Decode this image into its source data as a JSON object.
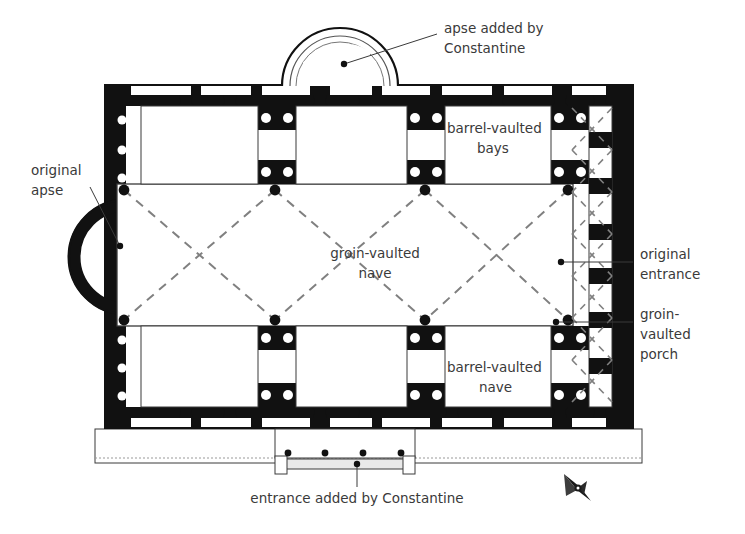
{
  "diagram": {
    "type": "architectural-floor-plan",
    "background_color": "#ffffff",
    "wall_color": "#111111",
    "line_color": "#3a3a3a",
    "text_color": "#3a3a3a",
    "dot_color": "#111111"
  },
  "labels": {
    "apse_added": {
      "line1": "apse added by",
      "line2": "Constantine"
    },
    "original_apse": {
      "line1": "original",
      "line2": "apse"
    },
    "barrel_bays": {
      "line1": "barrel-vaulted",
      "line2": "bays"
    },
    "groin_nave": {
      "line1": "groin-vaulted",
      "line2": "nave"
    },
    "barrel_nave": {
      "line1": "barrel-vaulted",
      "line2": "nave"
    },
    "original_entrance": {
      "line1": "original",
      "line2": "entrance"
    },
    "groin_porch": {
      "line1": "groin-",
      "line2": "vaulted",
      "line3": "porch"
    },
    "entrance_added": {
      "text": "entrance added by Constantine"
    }
  },
  "icons": {
    "compass": "compass-north-arrow-icon"
  },
  "plan_geometry": {
    "outer_wall": {
      "x": 104,
      "y": 84,
      "width": 530,
      "height": 345
    },
    "wall_thickness": 22,
    "nave_bays": 3,
    "porch_bays": 6,
    "apse_added_radius": 58,
    "original_apse_radius": 52,
    "entrance_columns": 4,
    "platform": {
      "x": 95,
      "y": 429,
      "width": 547,
      "height": 34
    }
  }
}
